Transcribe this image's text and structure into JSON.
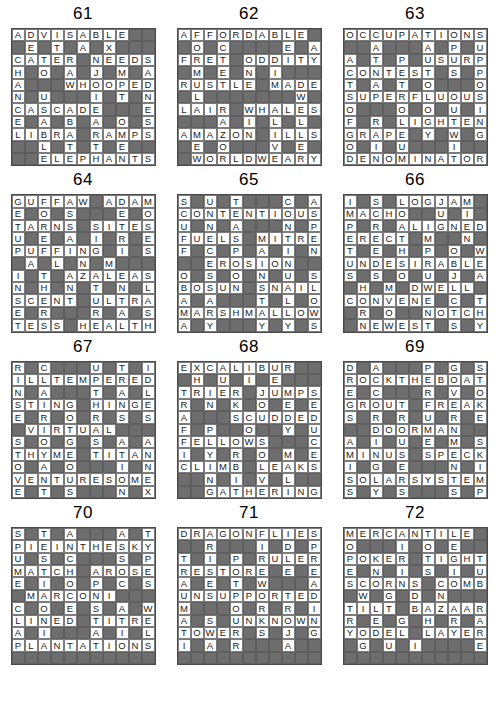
{
  "page": {
    "columns": 3,
    "rows": 4,
    "grid_size": 11,
    "colors": {
      "background": "#ffffff",
      "light_cell": "#ffffff",
      "block_cell": "#6e6e6e",
      "cell_border": "#8a8a8a",
      "text": "#1a1a1a"
    }
  },
  "puzzles": [
    {
      "number": "61",
      "rows": [
        "ADVISABLE..",
        ".E.T.A.X...",
        "CATER.NEEDS",
        "H.O.A.J.M.A",
        "A...WHOOPED",
        "N.U...I.T.N",
        "CASCADE...E",
        "E.A.B.A.O.S",
        "LIBRA.RAMPS",
        "..L.T.T.E..",
        "..ELEPHANTS"
      ]
    },
    {
      "number": "62",
      "rows": [
        "AFFORDABLE.",
        ".O.C....E.A",
        "FRET.ODDITY",
        ".M.E.N.I...",
        "RUSTLE.MADE",
        ".L.......W.",
        "LAIR.WHALES",
        "...A.I.L.L.",
        "AMAZON.ILLS",
        ".E.O...V.E.",
        ".WORLDWEARY"
      ]
    },
    {
      "number": "63",
      "rows": [
        "OCCUPATIONS",
        "..A...A.P.U",
        "A.T.P.USURP",
        "CONTEST.S.P",
        "T.A.T.O...O",
        "SUPERFLUOUS",
        "O...O.O.U.I",
        "F.R.LIGHTEN",
        "GRAPE.Y.W.G",
        "O.I.U...I..",
        "DENOMINATOR"
      ]
    },
    {
      "number": "64",
      "rows": [
        "GUFFAW.ADAM",
        "E.O.S...E.O",
        "TARNS.SITES",
        "U.E.A.I.R.E",
        "PUFFING.I.S",
        ".A.L.N.M...",
        "I.T.AZALEAS",
        "N.H.N.T.N.L",
        "SCENT.ULTRA",
        "E.R...R.A.S",
        "TESS.HEALTH"
      ]
    },
    {
      "number": "65",
      "rows": [
        "S.U.T...C.A",
        "CONTENTIOUS",
        "U.N.A...N.P",
        "FUELS.MITRE",
        "F.C.P.A.I.N",
        "..EROSION..",
        "O.S.O.N.U.S",
        "BOSUN.SNAIL",
        "A.A...T.L.O",
        "MARSHMALLOW",
        "A.Y...Y.Y.S"
      ]
    },
    {
      "number": "66",
      "rows": [
        "I.S.LOGJAM.",
        "MACHO..U.I.",
        "P.R.ALIGNED",
        "ERECT.M..N.",
        "T.E.H.P.O.W",
        "UNDESIRABLE",
        "S.S.O.U.J.A",
        ".H.M.DWELL.",
        "CONVENE.C.T",
        ".R.O..NOTCH",
        ".NEWEST.S.Y"
      ]
    },
    {
      "number": "67",
      "rows": [
        "R.C...U.T.I",
        "ILLTEMPERED",
        "N.A...T.A.L",
        "STING.HINGE",
        "E.R.O.R.S.S",
        ".VIRTUAL...",
        "S.O.G.S.A.A",
        "THYME.TITAN",
        "O.A.O...I.N",
        "VENTURESOME",
        "E.T.S...N.X"
      ]
    },
    {
      "number": "68",
      "rows": [
        "EXCALIBUR..",
        ".H.U.I.E...",
        "TRIER.JUMPS",
        "R.N.K.O.E.E",
        "A...SCUDDED",
        "F.P..O..Y.U",
        "FELLOWS...C",
        "I.Y.R.O.M.E",
        "CLIMB.LEAKS",
        "..N.I.V.L..",
        "..GATHERING"
      ]
    },
    {
      "number": "69",
      "rows": [
        "D.A...P.G.S",
        "ROCKTHEBOAT",
        "E.C...R.V.O",
        "GROUT.FREAK",
        "S.R.R.U.R.E",
        "..DOORMAN..",
        "A.I.U.E.M.S",
        "MINUS.SPECK",
        "I.G.E...N.I",
        "SOLARSYSTEM",
        "S.Y.S...S.P"
      ]
    },
    {
      "number": "70",
      "rows": [
        "S.T.A...A.T",
        "PIEINTHESKY",
        "U.S.C...S.P",
        "MATCH.AROSE",
        "E.I.O.P.C.S",
        ".MARCONI...",
        "C.O.E.S.A.W",
        "LINED.TITRE",
        "A.I...A.I.L",
        "PLANTATIONS",
        "..........."
      ]
    },
    {
      "number": "71",
      "rows": [
        "DRAGONFLIES",
        "..R...I.D.P",
        "T.I.P.RULER",
        "RESTORE.E.E",
        "A.E.T.W...A",
        "UNSUPPORTED",
        "M...O.R.R.I",
        "A.S.UNKNOWN",
        "TOWER.S.J.G",
        "I.A.R...A..",
        "..........."
      ]
    },
    {
      "number": "72",
      "rows": [
        "MERCANTILE.",
        "O...I.O.E..",
        "POKER.TIGHT",
        "E.N.I.S.I.U",
        "SCORNS.COMB",
        ".W.G.D.N...",
        "TILT.BAZAAR",
        "R.E.G.H.R.A",
        "YODEL.LAYER",
        ".G.U.I....E",
        "..........."
      ]
    }
  ]
}
